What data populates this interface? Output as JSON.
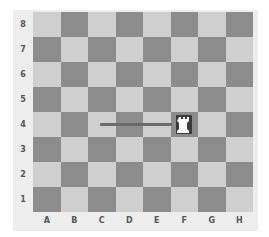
{
  "board": {
    "files": [
      "A",
      "B",
      "C",
      "D",
      "E",
      "F",
      "G",
      "H"
    ],
    "ranks": [
      "8",
      "7",
      "6",
      "5",
      "4",
      "3",
      "2",
      "1"
    ],
    "colors": {
      "light": "#cfcfcf",
      "dark": "#8c8c8c",
      "frame": "#ededed",
      "line": "#6b6b6b"
    },
    "pieces": [
      {
        "type": "rook",
        "color": "white",
        "square": "F4",
        "glyph": "♖"
      }
    ],
    "move_indicator": {
      "from_x_file": "C",
      "to_square": "F4",
      "rank": "4"
    }
  }
}
